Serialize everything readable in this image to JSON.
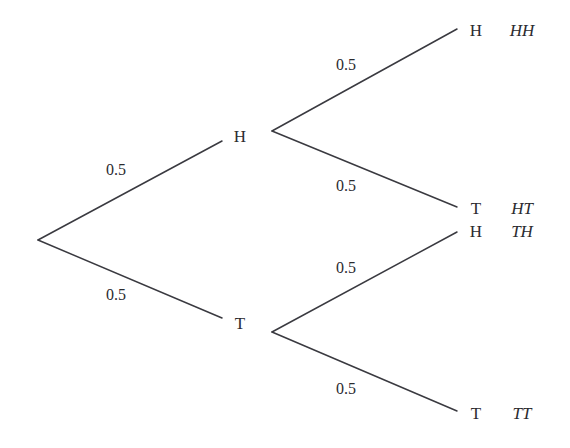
{
  "diagram": {
    "type": "probability-tree",
    "title": "",
    "background_color": "#ffffff",
    "line_color": "#3a3a40",
    "text_color": "#2b2b2f",
    "line_width": 1.5,
    "root": {
      "x": 38,
      "y": 240
    },
    "nodes": [
      {
        "id": "h1",
        "label": "H",
        "x": 240,
        "y": 136,
        "level": 1
      },
      {
        "id": "t1",
        "label": "T",
        "x": 240,
        "y": 323,
        "level": 1
      },
      {
        "id": "hh",
        "label": "H",
        "x": 476,
        "y": 30,
        "level": 2
      },
      {
        "id": "ht",
        "label": "T",
        "x": 476,
        "y": 208,
        "level": 2
      },
      {
        "id": "th",
        "label": "H",
        "x": 476,
        "y": 231,
        "level": 2
      },
      {
        "id": "tt",
        "label": "T",
        "x": 476,
        "y": 413,
        "level": 2
      }
    ],
    "outcomes": [
      {
        "id": "out-hh",
        "label": "HH",
        "x": 522,
        "y": 30
      },
      {
        "id": "out-ht",
        "label": "HT",
        "x": 522,
        "y": 208
      },
      {
        "id": "out-th",
        "label": "TH",
        "x": 522,
        "y": 231
      },
      {
        "id": "out-tt",
        "label": "TT",
        "x": 522,
        "y": 413
      }
    ],
    "edges": [
      {
        "id": "edge-root-h",
        "from": "root",
        "to": "h1",
        "x1": 38,
        "y1": 240,
        "x2": 222,
        "y2": 141,
        "probability": "0.5",
        "label_x": 116,
        "label_y": 170
      },
      {
        "id": "edge-root-t",
        "from": "root",
        "to": "t1",
        "x1": 38,
        "y1": 240,
        "x2": 222,
        "y2": 318,
        "probability": "0.5",
        "label_x": 116,
        "label_y": 295
      },
      {
        "id": "edge-h-hh",
        "from": "h1",
        "to": "hh",
        "x1": 272,
        "y1": 131,
        "x2": 457,
        "y2": 29,
        "probability": "0.5",
        "label_x": 346,
        "label_y": 65
      },
      {
        "id": "edge-h-ht",
        "from": "h1",
        "to": "ht",
        "x1": 272,
        "y1": 131,
        "x2": 457,
        "y2": 207,
        "probability": "0.5",
        "label_x": 346,
        "label_y": 186
      },
      {
        "id": "edge-t-th",
        "from": "t1",
        "to": "th",
        "x1": 272,
        "y1": 332,
        "x2": 457,
        "y2": 232,
        "probability": "0.5",
        "label_x": 346,
        "label_y": 268
      },
      {
        "id": "edge-t-tt",
        "from": "t1",
        "to": "tt",
        "x1": 272,
        "y1": 332,
        "x2": 457,
        "y2": 411,
        "probability": "0.5",
        "label_x": 346,
        "label_y": 389
      }
    ]
  },
  "chart_data": {
    "type": "diagram",
    "title": "",
    "tree": {
      "probability_per_branch": 0.5,
      "levels": 2,
      "first_flip": [
        {
          "outcome": "H",
          "probability": 0.5
        },
        {
          "outcome": "T",
          "probability": 0.5
        }
      ],
      "second_flip": [
        {
          "path": "H",
          "outcome": "H",
          "probability": 0.5,
          "joint": "HH"
        },
        {
          "path": "H",
          "outcome": "T",
          "probability": 0.5,
          "joint": "HT"
        },
        {
          "path": "T",
          "outcome": "H",
          "probability": 0.5,
          "joint": "TH"
        },
        {
          "path": "T",
          "outcome": "T",
          "probability": 0.5,
          "joint": "TT"
        }
      ],
      "leaf_outcomes": [
        "HH",
        "HT",
        "TH",
        "TT"
      ]
    }
  }
}
